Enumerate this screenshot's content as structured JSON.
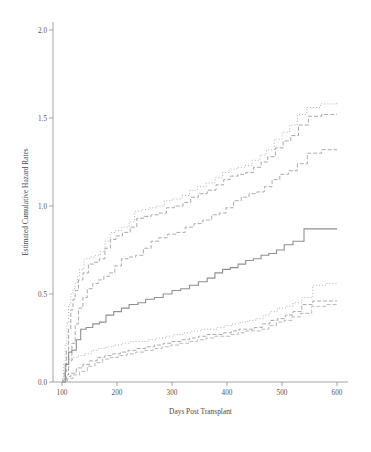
{
  "figure": {
    "background": "#ffffff",
    "axis_color": "#9a9a9a",
    "text_color": "#4a4a4a"
  },
  "chart_data": {
    "type": "line",
    "title": "",
    "subtitle": "",
    "xlabel": "Days Post Transplant",
    "ylabel": "Estimated Cumulative Hazard Rates",
    "xlim": [
      80,
      610
    ],
    "ylim": [
      -0.06,
      2.12
    ],
    "xticks": [
      100,
      200,
      300,
      400,
      500,
      600
    ],
    "xtick_labels": [
      "100",
      "200",
      "300",
      "400",
      "500",
      "600"
    ],
    "yticks": [
      0.0,
      0.5,
      1.0,
      1.5,
      2.0
    ],
    "ytick_labels": [
      "0.0",
      "0.5",
      "1.0",
      "1.5",
      "2.0"
    ],
    "grid": false,
    "legend": "none",
    "step_type": "post",
    "series": [
      {
        "name": "upper-band-dotted",
        "style": "dotted",
        "color": "#9e9e9e",
        "width": 0.8,
        "dash": "1,2",
        "x": [
          100,
          103,
          106,
          109,
          112,
          116,
          120,
          124,
          128,
          132,
          140,
          150,
          160,
          170,
          178,
          188,
          196,
          208,
          222,
          232,
          244,
          258,
          272,
          286,
          300,
          318,
          332,
          346,
          362,
          378,
          392,
          404,
          418,
          432,
          446,
          460,
          472,
          486,
          500,
          514,
          528,
          545,
          570,
          600
        ],
        "y": [
          0.02,
          0.1,
          0.22,
          0.34,
          0.44,
          0.5,
          0.53,
          0.56,
          0.6,
          0.64,
          0.7,
          0.71,
          0.72,
          0.74,
          0.8,
          0.85,
          0.86,
          0.88,
          0.91,
          0.97,
          0.98,
          0.99,
          1.0,
          1.03,
          1.04,
          1.06,
          1.09,
          1.11,
          1.13,
          1.16,
          1.19,
          1.21,
          1.22,
          1.23,
          1.26,
          1.29,
          1.32,
          1.38,
          1.42,
          1.46,
          1.52,
          1.56,
          1.58,
          1.59
        ]
      },
      {
        "name": "upper-band-dashed",
        "style": "dashed",
        "color": "#9e9e9e",
        "width": 0.9,
        "dash": "4,2",
        "x": [
          100,
          104,
          108,
          112,
          116,
          120,
          124,
          130,
          138,
          148,
          158,
          168,
          178,
          188,
          198,
          210,
          224,
          236,
          248,
          262,
          276,
          290,
          304,
          320,
          334,
          348,
          364,
          380,
          394,
          406,
          420,
          434,
          448,
          462,
          474,
          488,
          502,
          516,
          530,
          548,
          572,
          600
        ],
        "y": [
          0.01,
          0.06,
          0.18,
          0.3,
          0.41,
          0.47,
          0.52,
          0.58,
          0.62,
          0.67,
          0.68,
          0.7,
          0.76,
          0.81,
          0.83,
          0.85,
          0.88,
          0.93,
          0.94,
          0.95,
          0.96,
          0.99,
          1.0,
          1.02,
          1.05,
          1.07,
          1.09,
          1.12,
          1.15,
          1.17,
          1.18,
          1.19,
          1.22,
          1.25,
          1.28,
          1.33,
          1.37,
          1.4,
          1.46,
          1.51,
          1.52,
          1.52
        ]
      },
      {
        "name": "upper-band-dashdot",
        "style": "dash-dot",
        "color": "#a3a3a3",
        "width": 0.9,
        "dash": "4,2",
        "x": [
          100,
          106,
          112,
          118,
          124,
          130,
          138,
          146,
          156,
          166,
          176,
          186,
          196,
          208,
          220,
          234,
          248,
          262,
          276,
          292,
          308,
          324,
          340,
          356,
          372,
          386,
          398,
          412,
          426,
          440,
          454,
          468,
          482,
          496,
          512,
          528,
          546,
          572,
          600
        ],
        "y": [
          0.0,
          0.04,
          0.12,
          0.22,
          0.33,
          0.42,
          0.48,
          0.53,
          0.56,
          0.58,
          0.6,
          0.62,
          0.66,
          0.7,
          0.71,
          0.72,
          0.76,
          0.8,
          0.82,
          0.84,
          0.85,
          0.88,
          0.9,
          0.92,
          0.95,
          0.96,
          0.99,
          1.03,
          1.05,
          1.07,
          1.08,
          1.11,
          1.15,
          1.18,
          1.2,
          1.24,
          1.3,
          1.32,
          1.32
        ]
      },
      {
        "name": "center-solid",
        "style": "solid",
        "color": "#8f8f8f",
        "width": 1.1,
        "dash": "",
        "x": [
          100,
          106,
          112,
          118,
          126,
          134,
          144,
          156,
          168,
          180,
          194,
          208,
          222,
          238,
          252,
          268,
          284,
          300,
          316,
          332,
          348,
          364,
          378,
          392,
          406,
          420,
          434,
          448,
          462,
          476,
          490,
          504,
          520,
          540,
          570,
          600
        ],
        "y": [
          0.0,
          0.1,
          0.17,
          0.18,
          0.24,
          0.3,
          0.31,
          0.33,
          0.34,
          0.38,
          0.4,
          0.42,
          0.44,
          0.45,
          0.47,
          0.48,
          0.5,
          0.52,
          0.53,
          0.55,
          0.57,
          0.59,
          0.62,
          0.64,
          0.65,
          0.67,
          0.69,
          0.7,
          0.72,
          0.73,
          0.75,
          0.78,
          0.8,
          0.87,
          0.87,
          0.87
        ]
      },
      {
        "name": "lower-band-dotted",
        "style": "dotted",
        "color": "#a0a0a0",
        "width": 0.8,
        "dash": "1,2",
        "x": [
          100,
          106,
          112,
          120,
          130,
          142,
          154,
          166,
          180,
          194,
          208,
          224,
          240,
          256,
          272,
          288,
          304,
          320,
          336,
          352,
          368,
          382,
          396,
          410,
          424,
          438,
          452,
          466,
          478,
          492,
          506,
          520,
          536,
          556,
          580,
          600
        ],
        "y": [
          0.0,
          0.06,
          0.13,
          0.14,
          0.15,
          0.16,
          0.18,
          0.19,
          0.2,
          0.21,
          0.22,
          0.23,
          0.23,
          0.24,
          0.25,
          0.26,
          0.27,
          0.28,
          0.29,
          0.3,
          0.3,
          0.31,
          0.32,
          0.33,
          0.34,
          0.35,
          0.36,
          0.38,
          0.4,
          0.42,
          0.43,
          0.45,
          0.48,
          0.55,
          0.56,
          0.56
        ]
      },
      {
        "name": "lower-band-dashed",
        "style": "dashed",
        "color": "#a0a0a0",
        "width": 0.9,
        "dash": "4,2",
        "x": [
          100,
          108,
          116,
          126,
          138,
          150,
          164,
          178,
          192,
          206,
          220,
          236,
          252,
          268,
          284,
          300,
          316,
          332,
          348,
          364,
          380,
          394,
          408,
          422,
          436,
          450,
          464,
          478,
          492,
          506,
          520,
          536,
          556,
          580,
          600
        ],
        "y": [
          0.0,
          0.03,
          0.05,
          0.08,
          0.1,
          0.12,
          0.14,
          0.15,
          0.16,
          0.17,
          0.18,
          0.19,
          0.2,
          0.21,
          0.22,
          0.23,
          0.24,
          0.25,
          0.26,
          0.27,
          0.27,
          0.28,
          0.29,
          0.3,
          0.3,
          0.31,
          0.33,
          0.35,
          0.36,
          0.38,
          0.4,
          0.44,
          0.46,
          0.46,
          0.46
        ]
      },
      {
        "name": "lower-band-dashdot",
        "style": "dash-dot",
        "color": "#a8a8a8",
        "width": 0.8,
        "dash": "4,2",
        "x": [
          100,
          110,
          120,
          132,
          146,
          160,
          174,
          188,
          202,
          218,
          234,
          250,
          266,
          282,
          298,
          314,
          330,
          346,
          362,
          378,
          392,
          406,
          420,
          434,
          448,
          462,
          476,
          490,
          504,
          518,
          534,
          554,
          580,
          600
        ],
        "y": [
          0.0,
          0.02,
          0.04,
          0.06,
          0.09,
          0.11,
          0.13,
          0.14,
          0.15,
          0.16,
          0.17,
          0.18,
          0.19,
          0.2,
          0.21,
          0.22,
          0.23,
          0.24,
          0.25,
          0.26,
          0.26,
          0.27,
          0.28,
          0.29,
          0.29,
          0.3,
          0.32,
          0.34,
          0.35,
          0.37,
          0.39,
          0.43,
          0.44,
          0.44
        ]
      }
    ]
  }
}
